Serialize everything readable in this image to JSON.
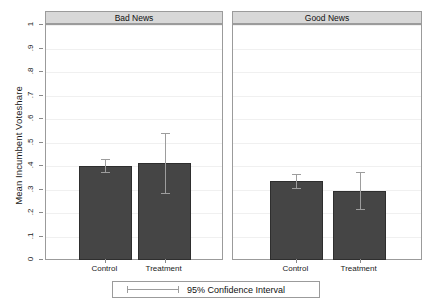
{
  "chart_data": {
    "type": "bar",
    "title": "",
    "xlabel": "",
    "ylabel": "Mean Incumbent Voteshare",
    "ylim": [
      0,
      1
    ],
    "yticks": [
      "0",
      ".1",
      ".2",
      ".3",
      ".4",
      ".5",
      ".6",
      ".7",
      ".8",
      ".9",
      "1"
    ],
    "ytick_values": [
      0,
      0.1,
      0.2,
      0.3,
      0.4,
      0.5,
      0.6,
      0.7,
      0.8,
      0.9,
      1
    ],
    "grid": true,
    "legend_position": "bottom",
    "legend": [
      "95% Confidence Interval"
    ],
    "categories": [
      "Control",
      "Treatment"
    ],
    "panels": [
      {
        "label": "Bad News",
        "categories": [
          "Control",
          "Treatment"
        ],
        "values": [
          0.401,
          0.412
        ],
        "ci_low": [
          0.374,
          0.285
        ],
        "ci_high": [
          0.431,
          0.541
        ]
      },
      {
        "label": "Good News",
        "categories": [
          "Control",
          "Treatment"
        ],
        "values": [
          0.337,
          0.295
        ],
        "ci_low": [
          0.307,
          0.215
        ],
        "ci_high": [
          0.368,
          0.376
        ]
      }
    ],
    "colors": {
      "bar_fill": "#454545",
      "bar_edge": "#2e2e2e",
      "error_bar": "#9d9d9d",
      "panel_header_bg": "#d8d8d8",
      "frame": "#9b9b9b",
      "gridline": "#f0f0f0",
      "background": "#ffffff"
    }
  }
}
